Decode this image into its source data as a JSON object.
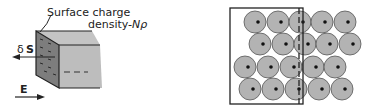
{
  "left_figure": {
    "caption_line1": "Surface charge",
    "caption_line2": "density",
    "caption_symbol": "-Nρ",
    "dS_label_prefix": "δ",
    "dS_label_bold": "S",
    "E_label": "E",
    "colors": {
      "front_face": "#7d7d7d",
      "top_face": "#c4c4c4",
      "side_face": "#bdbdbd",
      "outline": "#222222"
    }
  },
  "right_figure": {
    "description": "Lattice of ions (grey circles with dark center dots) with a box boundary; dashed line marks displaced electron boundary",
    "circle_fill": "#b3b3b3",
    "circle_stroke": "#555555",
    "rows": [
      {
        "y": 22,
        "xs": [
          255,
          278,
          300,
          322,
          345
        ]
      },
      {
        "y": 44,
        "xs": [
          260,
          283,
          305,
          327,
          350
        ]
      },
      {
        "y": 67,
        "xs": [
          245,
          268,
          291,
          313,
          335
        ]
      },
      {
        "y": 89,
        "xs": [
          250,
          273,
          296,
          319,
          342
        ]
      }
    ],
    "box": {
      "x": 230,
      "y": 8,
      "w": 73,
      "h": 96
    },
    "dashed_x": 299
  }
}
